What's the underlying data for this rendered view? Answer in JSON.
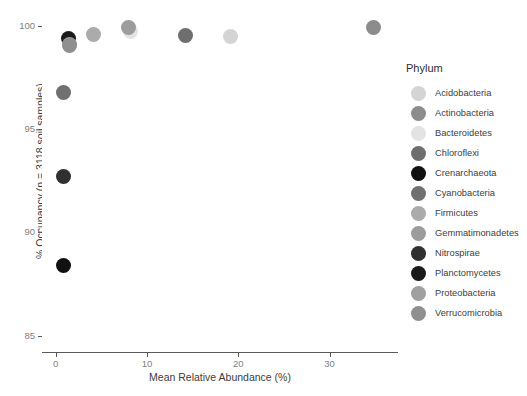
{
  "chart_data": {
    "type": "scatter",
    "title": "",
    "xlabel": "Mean Relative Abundance (%)",
    "ylabel": "% Occupancy (n = 3118 soil samples)",
    "xlim": [
      -1.5,
      37.5
    ],
    "ylim": [
      84.2,
      100.6
    ],
    "xticks": [
      0,
      10,
      20,
      30
    ],
    "xtick_labels": [
      "0",
      "10",
      "20",
      "30"
    ],
    "yticks": [
      85,
      90,
      95,
      100
    ],
    "ytick_labels": [
      "85",
      "90",
      "95",
      "100"
    ],
    "grid": false,
    "legend_position": "right",
    "legend_title": "Phylum",
    "point_size": 15,
    "series": [
      {
        "name": "Acidobacteria",
        "color": "#d4d4d4",
        "x": 19.1,
        "y": 99.5
      },
      {
        "name": "Actinobacteria",
        "color": "#8c8c8c",
        "x": 34.8,
        "y": 99.95
      },
      {
        "name": "Bacteroidetes",
        "color": "#e3e3e3",
        "x": 8.2,
        "y": 99.75
      },
      {
        "name": "Chloroflexi",
        "color": "#6e6e6e",
        "x": 14.2,
        "y": 99.55
      },
      {
        "name": "Crenarchaeota",
        "color": "#111111",
        "x": 0.9,
        "y": 88.4
      },
      {
        "name": "Cyanobacteria",
        "color": "#707070",
        "x": 0.85,
        "y": 96.8
      },
      {
        "name": "Firmicutes",
        "color": "#ababab",
        "x": 4.1,
        "y": 99.6
      },
      {
        "name": "Gemmatimonadetes",
        "color": "#9c9c9c",
        "x": 8.0,
        "y": 99.95
      },
      {
        "name": "Nitrospirae",
        "color": "#303030",
        "x": 0.9,
        "y": 92.7
      },
      {
        "name": "Planctomycetes",
        "color": "#1a1a1a",
        "x": 1.35,
        "y": 99.4
      },
      {
        "name": "Proteobacteria",
        "color": "#a0a0a0",
        "x": 1.5,
        "y": 99.1
      },
      {
        "name": "Verrucomicrobia",
        "color": "#8f8f8f",
        "x": 1.5,
        "y": 99.05
      }
    ]
  },
  "legend": {
    "title": "Phylum",
    "items": [
      {
        "label": "Acidobacteria",
        "color": "#d4d4d4"
      },
      {
        "label": "Actinobacteria",
        "color": "#8c8c8c"
      },
      {
        "label": "Bacteroidetes",
        "color": "#e3e3e3"
      },
      {
        "label": "Chloroflexi",
        "color": "#6e6e6e"
      },
      {
        "label": "Crenarchaeota",
        "color": "#111111"
      },
      {
        "label": "Cyanobacteria",
        "color": "#707070"
      },
      {
        "label": "Firmicutes",
        "color": "#ababab"
      },
      {
        "label": "Gemmatimonadetes",
        "color": "#9c9c9c"
      },
      {
        "label": "Nitrospirae",
        "color": "#303030"
      },
      {
        "label": "Planctomycetes",
        "color": "#1a1a1a"
      },
      {
        "label": "Proteobacteria",
        "color": "#a0a0a0"
      },
      {
        "label": "Verrucomicrobia",
        "color": "#8f8f8f"
      }
    ]
  },
  "axes": {
    "x_title": "Mean Relative Abundance (%)",
    "y_title": "% Occupancy (n = 3118 soil samples)"
  }
}
